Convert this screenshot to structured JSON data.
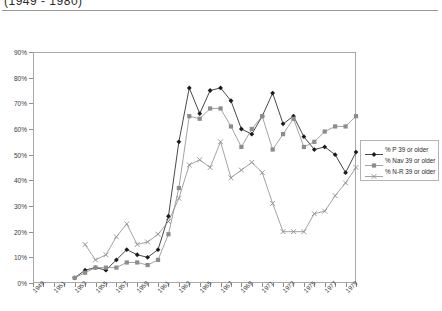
{
  "header": {
    "title": "(1949 - 1980)"
  },
  "chart_data": {
    "type": "line",
    "title": "(1949 - 1980)",
    "xlabel": "",
    "ylabel": "",
    "ylim": [
      0,
      90
    ],
    "ytick_labels": [
      "0%",
      "10%",
      "20%",
      "30%",
      "40%",
      "50%",
      "60%",
      "70%",
      "80%",
      "90%"
    ],
    "ytick_values": [
      0,
      10,
      20,
      30,
      40,
      50,
      60,
      70,
      80,
      90
    ],
    "grid": "horizontal",
    "legend_position": "right",
    "x": [
      1949,
      1950,
      1951,
      1952,
      1953,
      1954,
      1955,
      1956,
      1957,
      1958,
      1959,
      1960,
      1961,
      1962,
      1963,
      1964,
      1965,
      1966,
      1967,
      1968,
      1969,
      1970,
      1971,
      1972,
      1973,
      1974,
      1975,
      1976,
      1977,
      1978,
      1979,
      1980
    ],
    "xtick_labels": [
      "1949",
      "1951",
      "1953",
      "1955",
      "1957",
      "1959",
      "1961",
      "1963",
      "1965",
      "1967",
      "1969",
      "1971",
      "1973",
      "1975",
      "1977",
      "1979"
    ],
    "xtick_values": [
      1949,
      1951,
      1953,
      1955,
      1957,
      1959,
      1961,
      1963,
      1965,
      1967,
      1969,
      1971,
      1973,
      1975,
      1977,
      1979
    ],
    "series": [
      {
        "name": "% P 39 or older",
        "color": "#1a1a1a",
        "marker": "diamond",
        "values": [
          null,
          null,
          null,
          null,
          2,
          5,
          6,
          5,
          9,
          13,
          11,
          10,
          13,
          26,
          55,
          76,
          66,
          75,
          76,
          71,
          60,
          58,
          65,
          74,
          62,
          65,
          57,
          52,
          53,
          50,
          43,
          51
        ]
      },
      {
        "name": "% Nav 39 or older",
        "color": "#8c8c8c",
        "marker": "square",
        "values": [
          null,
          null,
          null,
          null,
          2,
          4,
          6,
          6,
          6,
          8,
          8,
          7,
          9,
          19,
          37,
          65,
          64,
          68,
          68,
          61,
          53,
          60,
          65,
          52,
          58,
          64,
          53,
          55,
          59,
          61,
          61,
          65
        ]
      },
      {
        "name": "% N-R 39 or older",
        "color": "#8c8c8c",
        "marker": "cross",
        "values": [
          null,
          null,
          null,
          null,
          null,
          15,
          9,
          11,
          18,
          23,
          15,
          16,
          19,
          24,
          33,
          46,
          48,
          45,
          55,
          41,
          44,
          47,
          43,
          31,
          20,
          20,
          20,
          27,
          28,
          34,
          39,
          45
        ]
      }
    ]
  },
  "legend": {
    "entries": [
      {
        "label": "% P 39 or older"
      },
      {
        "label": "% Nav 39 or older"
      },
      {
        "label": "% N-R 39 or older"
      }
    ]
  }
}
